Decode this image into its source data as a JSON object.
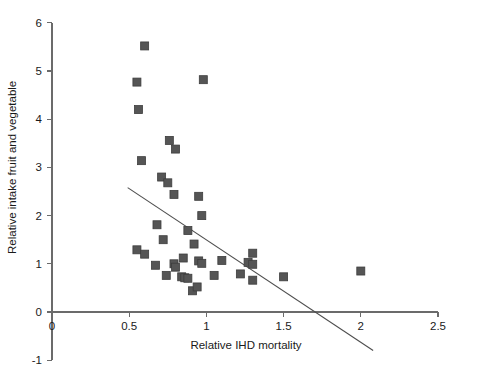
{
  "chart_data": {
    "type": "scatter",
    "title": "",
    "xlabel": "Relative IHD mortality",
    "ylabel": "Relative intake fruit and vegetable",
    "xlim": [
      0,
      2.5
    ],
    "ylim": [
      -1,
      6
    ],
    "xticks": [
      0,
      0.5,
      1,
      1.5,
      2,
      2.5
    ],
    "xtick_labels": [
      "0",
      "0.5",
      "1",
      "1.5",
      "2",
      "2.5"
    ],
    "yticks": [
      -1,
      0,
      1,
      2,
      3,
      4,
      5,
      6
    ],
    "ytick_labels": [
      "-1",
      "0",
      "1",
      "2",
      "3",
      "4",
      "5",
      "6"
    ],
    "grid": false,
    "legend": false,
    "marker": {
      "shape": "square",
      "color": "#555555",
      "edge_color": "#3d3d3d",
      "size_px": 8
    },
    "series": [
      {
        "name": "countries",
        "points": [
          [
            0.6,
            5.52
          ],
          [
            0.55,
            4.77
          ],
          [
            0.98,
            4.82
          ],
          [
            0.56,
            4.2
          ],
          [
            0.76,
            3.56
          ],
          [
            0.8,
            3.38
          ],
          [
            0.58,
            3.14
          ],
          [
            0.71,
            2.8
          ],
          [
            0.75,
            2.68
          ],
          [
            0.79,
            2.44
          ],
          [
            0.95,
            2.4
          ],
          [
            0.97,
            2.0
          ],
          [
            0.68,
            1.81
          ],
          [
            0.88,
            1.69
          ],
          [
            0.72,
            1.5
          ],
          [
            0.92,
            1.41
          ],
          [
            0.55,
            1.29
          ],
          [
            0.6,
            1.2
          ],
          [
            0.85,
            1.12
          ],
          [
            1.3,
            1.22
          ],
          [
            0.67,
            0.97
          ],
          [
            0.79,
            1.0
          ],
          [
            0.8,
            0.93
          ],
          [
            0.95,
            1.06
          ],
          [
            0.97,
            1.01
          ],
          [
            1.1,
            1.07
          ],
          [
            1.27,
            1.03
          ],
          [
            1.3,
            0.99
          ],
          [
            0.74,
            0.76
          ],
          [
            0.84,
            0.73
          ],
          [
            0.86,
            0.71
          ],
          [
            0.88,
            0.7
          ],
          [
            1.05,
            0.76
          ],
          [
            1.22,
            0.79
          ],
          [
            1.3,
            0.66
          ],
          [
            1.5,
            0.73
          ],
          [
            0.91,
            0.44
          ],
          [
            0.94,
            0.52
          ],
          [
            2.0,
            0.85
          ]
        ]
      }
    ],
    "fit_line": {
      "x_start": 0.49,
      "y_start": 2.58,
      "x_end": 2.08,
      "y_end": -0.8
    }
  }
}
